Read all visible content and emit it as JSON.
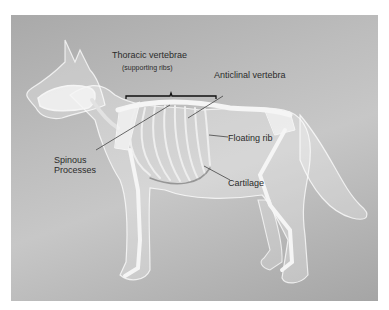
{
  "figure": {
    "labels": {
      "thoracic_title": "Thoracic vertebrae",
      "thoracic_sub": "(supporting ribs)",
      "anticlinal": "Anticlinal vertebra",
      "floating_rib": "Floating rib",
      "spinous_1": "Spinous",
      "spinous_2": "Processes",
      "cartilage": "Cartilage"
    },
    "colors": {
      "background_light": "#c7c7c7",
      "background_dark": "#a5a5a5",
      "body_outline": "#eeeeee",
      "bone": "#f4f4f4",
      "label_text": "#2b2b2b",
      "pointer_line": "#444444"
    }
  }
}
